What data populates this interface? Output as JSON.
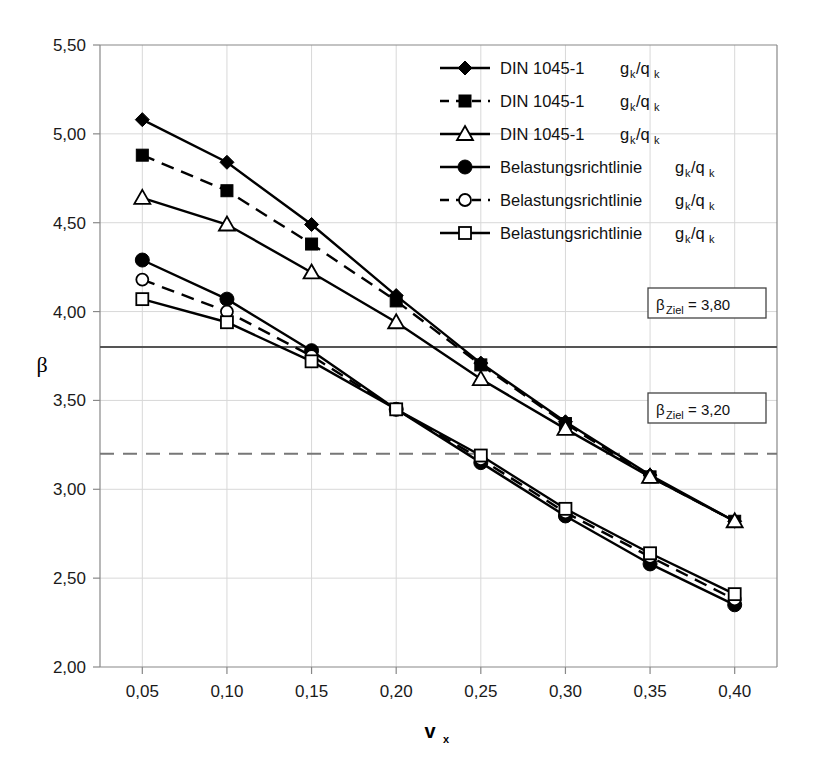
{
  "chart_data": {
    "type": "line",
    "title": "",
    "xlabel": "v_x",
    "ylabel": "β",
    "xlim": [
      0.025,
      0.425
    ],
    "ylim": [
      2.0,
      5.5
    ],
    "grid": true,
    "legend_position": "top-right",
    "x": [
      0.05,
      0.1,
      0.15,
      0.2,
      0.25,
      0.3,
      0.35,
      0.4
    ],
    "xtick_labels": [
      "0,05",
      "0,10",
      "0,15",
      "0,20",
      "0,25",
      "0,30",
      "0,35",
      "0,40"
    ],
    "ytick_values": [
      2.0,
      2.5,
      3.0,
      3.5,
      4.0,
      4.5,
      5.0,
      5.5
    ],
    "ytick_labels": [
      "2,00",
      "2,50",
      "3,00",
      "3,50",
      "4,00",
      "4,50",
      "5,00",
      "5,50"
    ],
    "series": [
      {
        "name": "DIN 1045-1",
        "ratio": "70/30",
        "marker": "filled-diamond",
        "dash": false,
        "values": [
          5.08,
          4.84,
          4.49,
          4.09,
          3.71,
          3.38,
          3.08,
          2.82
        ]
      },
      {
        "name": "DIN 1045-1",
        "ratio": "60/40",
        "marker": "filled-square",
        "dash": true,
        "values": [
          4.88,
          4.68,
          4.38,
          4.06,
          3.7,
          3.37,
          3.07,
          2.82
        ]
      },
      {
        "name": "DIN 1045-1",
        "ratio": "50/50",
        "marker": "open-triangle",
        "dash": false,
        "values": [
          4.64,
          4.49,
          4.22,
          3.94,
          3.62,
          3.34,
          3.07,
          2.82
        ]
      },
      {
        "name": "Belastungsrichtlinie",
        "ratio": "70/30",
        "marker": "filled-circle",
        "dash": false,
        "values": [
          4.29,
          4.07,
          3.78,
          3.45,
          3.15,
          2.85,
          2.58,
          2.35
        ]
      },
      {
        "name": "Belastungsrichtlinie",
        "ratio": "60/40",
        "marker": "open-circle",
        "dash": true,
        "values": [
          4.18,
          4.0,
          3.75,
          3.45,
          3.17,
          2.87,
          2.62,
          2.38
        ]
      },
      {
        "name": "Belastungsrichtlinie",
        "ratio": "50/50",
        "marker": "open-square",
        "dash": false,
        "values": [
          4.07,
          3.94,
          3.72,
          3.45,
          3.19,
          2.89,
          2.64,
          2.41
        ]
      }
    ],
    "threshold_lines": [
      {
        "label": "β",
        "sub": "Ziel",
        "eq": " = 3,80",
        "value": 3.8,
        "dash": false,
        "color": "#555555"
      },
      {
        "label": "β",
        "sub": "Ziel",
        "eq": " = 3,20",
        "value": 3.2,
        "dash": true,
        "color": "#777777"
      }
    ]
  },
  "legend": {
    "items": [
      {
        "name": "DIN 1045-1",
        "ratio_prefix": "g",
        "ratio_sub1": "k",
        "ratio_mid": "/q",
        "ratio_sub2": "k",
        "ratio_eq": " = 70/30",
        "full_ratio": "gₖ/qₖ = 70/30"
      },
      {
        "name": "DIN 1045-1",
        "full_ratio": "gₖ/qₖ = 60/40"
      },
      {
        "name": "DIN 1045-1",
        "full_ratio": "gₖ/qₖ = 50/50"
      },
      {
        "name": "Belastungsrichtlinie",
        "full_ratio": "gₖ/qₖ = 70/30"
      },
      {
        "name": "Belastungsrichtlinie",
        "full_ratio": "gₖ/qₖ = 60/40"
      },
      {
        "name": "Belastungsrichtlinie",
        "full_ratio": "gₖ/qₖ = 50/50"
      }
    ]
  },
  "annotations": {
    "upper": {
      "beta": "β",
      "sub": "Ziel",
      "value": " = 3,80"
    },
    "lower": {
      "beta": "β",
      "sub": "Ziel",
      "value": " = 3,20"
    }
  },
  "axes": {
    "y_title": "β",
    "x_title_main": "v",
    "x_title_sub": "x"
  },
  "colors": {
    "line": "#000000",
    "grid": "#d8d8d8",
    "frame": "#888888",
    "threshold_solid": "#555555",
    "threshold_dashed": "#808080",
    "background": "#ffffff"
  }
}
